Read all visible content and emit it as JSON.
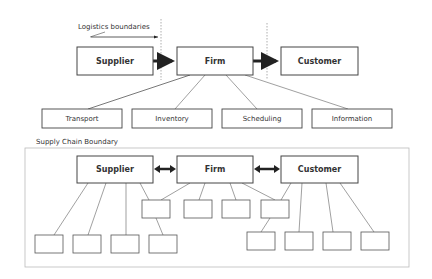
{
  "top_diagram": {
    "annotation": "Logistics boundaries",
    "main_nodes": [
      {
        "label": "Supplier",
        "x": 77,
        "y": 47,
        "w": 76,
        "h": 28
      },
      {
        "label": "Firm",
        "x": 177,
        "y": 47,
        "w": 76,
        "h": 28
      },
      {
        "label": "Customer",
        "x": 281,
        "y": 47,
        "w": 77,
        "h": 28
      }
    ],
    "functions": [
      {
        "label": "Transport",
        "x": 42,
        "y": 109,
        "w": 80,
        "h": 19
      },
      {
        "label": "Inventory",
        "x": 132,
        "y": 109,
        "w": 80,
        "h": 19
      },
      {
        "label": "Scheduling",
        "x": 222,
        "y": 109,
        "w": 80,
        "h": 19
      },
      {
        "label": "Information",
        "x": 312,
        "y": 109,
        "w": 80,
        "h": 19
      }
    ]
  },
  "bottom_diagram": {
    "boundary_label": "Supply Chain Boundary",
    "main_nodes": [
      {
        "label": "Supplier",
        "x": 77,
        "y": 156,
        "w": 76,
        "h": 27
      },
      {
        "label": "Firm",
        "x": 177,
        "y": 156,
        "w": 76,
        "h": 27
      },
      {
        "label": "Customer",
        "x": 281,
        "y": 156,
        "w": 77,
        "h": 27
      }
    ]
  },
  "colors": {
    "box_stroke": "#444444",
    "line": "#666666",
    "arrow": "#222222",
    "boundary": "#bbbbbb",
    "text": "#333333"
  }
}
